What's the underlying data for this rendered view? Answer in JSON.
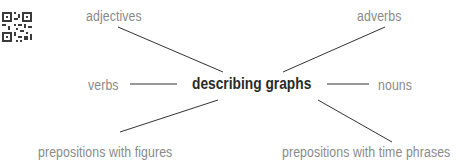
{
  "diagram": {
    "type": "spider-diagram",
    "center": {
      "label": "describing graphs"
    },
    "branches": [
      {
        "label": "adjectives",
        "position": "top-left"
      },
      {
        "label": "adverbs",
        "position": "top-right"
      },
      {
        "label": "verbs",
        "position": "left"
      },
      {
        "label": "nouns",
        "position": "right"
      },
      {
        "label": "prepositions with figures",
        "position": "bottom-left"
      },
      {
        "label": "prepositions with time phrases",
        "position": "bottom-right"
      }
    ],
    "colors": {
      "center_text": "#2a2a2a",
      "branch_text": "#8a8a8a",
      "line": "#333333"
    }
  }
}
